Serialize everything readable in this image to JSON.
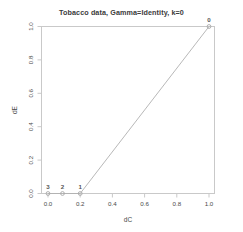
{
  "chart_data": {
    "type": "line",
    "title": "Tobacco data, Gamma=Identity, k=0",
    "xlabel": "dC",
    "ylabel": "dE",
    "xlim": [
      0.0,
      1.0
    ],
    "ylim": [
      0.0,
      1.0
    ],
    "grid": false,
    "legend": "none",
    "xticks": [
      "0.0",
      "0.2",
      "0.4",
      "0.6",
      "0.8",
      "1.0"
    ],
    "xtick_values": [
      0.0,
      0.2,
      0.4,
      0.6,
      0.8,
      1.0
    ],
    "yticks": [
      "0.0",
      "0.2",
      "0.4",
      "0.6",
      "0.8",
      "1.0"
    ],
    "ytick_values": [
      0.0,
      0.2,
      0.4,
      0.6,
      0.8,
      1.0
    ],
    "series": [
      {
        "name": "ROC path",
        "marker": "open-circle",
        "line_color": "#b0b0b0",
        "marker_color": "#a8a8a8",
        "x": [
          0.0,
          0.09,
          0.2,
          1.0
        ],
        "y": [
          0.0,
          0.0,
          0.0,
          1.0
        ],
        "point_labels": [
          "3",
          "2",
          "1",
          "0"
        ]
      }
    ],
    "annotations": [
      {
        "text": "3",
        "x": 0.0,
        "y": 0.0
      },
      {
        "text": "2",
        "x": 0.09,
        "y": 0.0
      },
      {
        "text": "1",
        "x": 0.2,
        "y": 0.0
      },
      {
        "text": "0",
        "x": 1.0,
        "y": 1.0
      }
    ]
  },
  "plot_box": {
    "frame_color": "#c9c9c9",
    "background": "#ffffff"
  }
}
